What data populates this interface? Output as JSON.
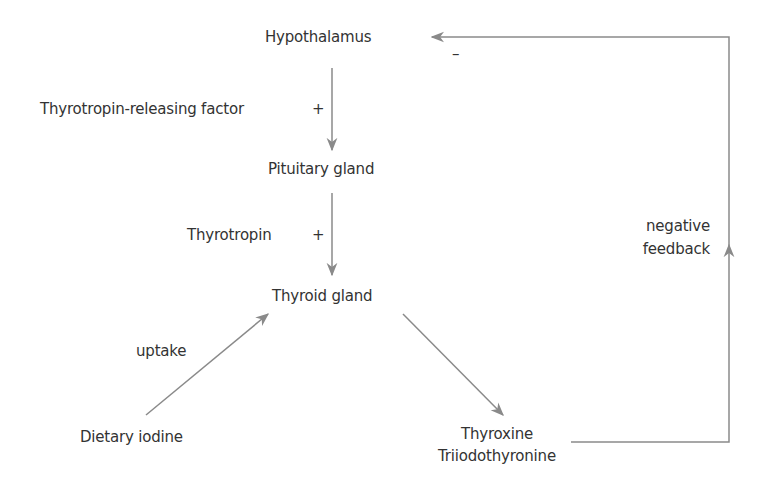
{
  "diagram": {
    "title": "",
    "nodes": {
      "hypothalamus": "Hypothalamus",
      "pituitary": "Pituitary gland",
      "thyroid": "Thyroid gland",
      "iodine": "Dietary iodine",
      "hormone1": "Thyroxine",
      "hormone2": "Triiodothyronine"
    },
    "edges": {
      "trf": "Thyrotropin-releasing factor",
      "trf_sign": "+",
      "tsh": "Thyrotropin",
      "tsh_sign": "+",
      "uptake": "uptake",
      "feedback_line1": "negative",
      "feedback_line2": "feedback",
      "feedback_sign": "–"
    },
    "colors": {
      "arrow": "#8a8a8a",
      "text": "#333333"
    }
  }
}
